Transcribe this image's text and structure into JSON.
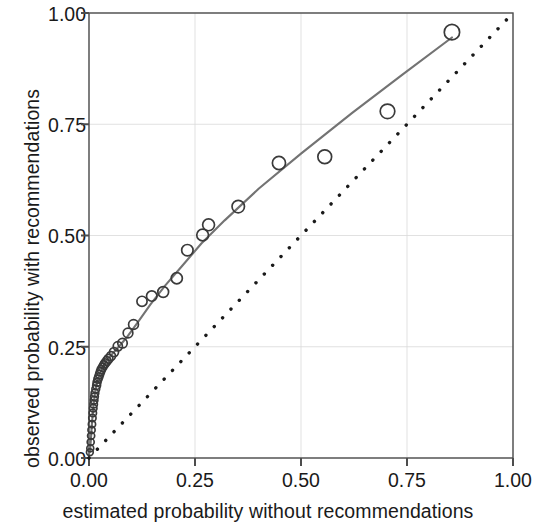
{
  "chart_data": {
    "type": "scatter",
    "title": "",
    "xlabel": "estimated probability without recommendations",
    "ylabel": "observed probability with recommendations",
    "xlim": [
      0.0,
      1.0
    ],
    "ylim": [
      0.0,
      1.0
    ],
    "xticks": [
      "0.00",
      "0.25",
      "0.50",
      "0.75",
      "1.00"
    ],
    "xtick_values": [
      0.0,
      0.25,
      0.5,
      0.75,
      1.0
    ],
    "yticks": [
      "0.00",
      "0.25",
      "0.50",
      "0.75",
      "1.00"
    ],
    "ytick_values": [
      0.0,
      0.25,
      0.5,
      0.75,
      1.0
    ],
    "grid": true,
    "legend": "none",
    "background": "#ffffff",
    "panel_color": "#ffffff",
    "grid_color": "#d9d9d9",
    "axis_color": "#4d4d4d",
    "point_color": "#3a3a3a",
    "fit_line_color": "#737373",
    "reference_line_color": "#1a1a1a",
    "series": [
      {
        "name": "observed vs estimated probability",
        "marker": "open-circle",
        "x": [
          0.002,
          0.003,
          0.004,
          0.005,
          0.006,
          0.007,
          0.008,
          0.009,
          0.01,
          0.011,
          0.012,
          0.013,
          0.014,
          0.016,
          0.018,
          0.019,
          0.021,
          0.023,
          0.025,
          0.027,
          0.029,
          0.032,
          0.035,
          0.038,
          0.042,
          0.046,
          0.052,
          0.059,
          0.068,
          0.079,
          0.092,
          0.105,
          0.125,
          0.148,
          0.175,
          0.207,
          0.232,
          0.268,
          0.282,
          0.352,
          0.448,
          0.556,
          0.704,
          0.856
        ],
        "y": [
          0.013,
          0.022,
          0.036,
          0.05,
          0.063,
          0.076,
          0.09,
          0.101,
          0.112,
          0.121,
          0.13,
          0.138,
          0.146,
          0.155,
          0.163,
          0.17,
          0.177,
          0.182,
          0.188,
          0.194,
          0.199,
          0.204,
          0.209,
          0.213,
          0.218,
          0.223,
          0.229,
          0.238,
          0.251,
          0.258,
          0.281,
          0.3,
          0.352,
          0.364,
          0.373,
          0.404,
          0.467,
          0.501,
          0.524,
          0.565,
          0.663,
          0.677,
          0.779,
          0.957
        ]
      }
    ],
    "fit_curve": {
      "name": "smoothed fit",
      "style": "solid",
      "color": "#737373",
      "x": [
        0.002,
        0.004,
        0.007,
        0.01,
        0.014,
        0.019,
        0.025,
        0.032,
        0.042,
        0.055,
        0.07,
        0.09,
        0.115,
        0.145,
        0.18,
        0.22,
        0.265,
        0.32,
        0.4,
        0.5,
        0.62,
        0.74,
        0.856
      ],
      "y": [
        0.013,
        0.036,
        0.078,
        0.112,
        0.146,
        0.171,
        0.188,
        0.204,
        0.219,
        0.234,
        0.25,
        0.272,
        0.305,
        0.345,
        0.388,
        0.432,
        0.482,
        0.534,
        0.605,
        0.684,
        0.775,
        0.862,
        0.945
      ]
    },
    "reference_line": {
      "name": "identity line y = x",
      "style": "dotted",
      "color": "#1a1a1a",
      "from": [
        0.0,
        0.0
      ],
      "to": [
        1.0,
        1.0
      ]
    }
  }
}
